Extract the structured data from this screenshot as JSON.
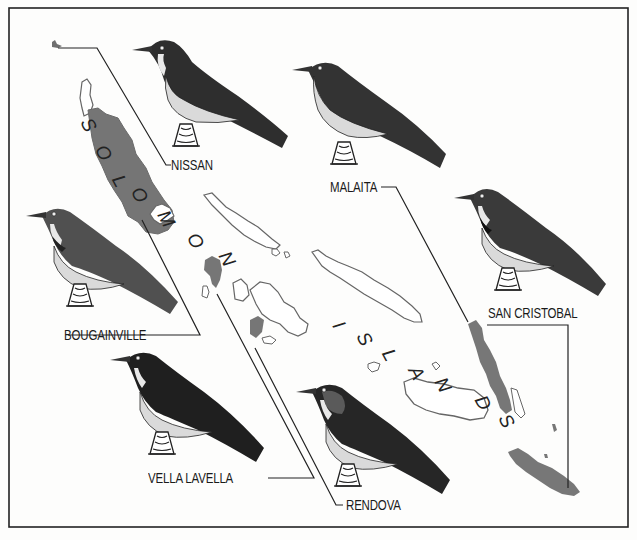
{
  "map": {
    "title_letters": [
      "S",
      "O",
      "L",
      "O",
      "M",
      "O",
      "N",
      "I",
      "S",
      "L",
      "A",
      "N",
      "D",
      "S"
    ],
    "title": "SOLOMON ISLANDS",
    "colors": {
      "frame": "#222222",
      "highlighted_island": "#7a7a7a",
      "island_outline": "#666666",
      "bird_dark": "#2a2a2a",
      "bird_mid": "#555555",
      "bird_belly": "#d8d8d8",
      "leader_line": "#222222"
    },
    "labels": [
      {
        "id": "nissan",
        "text": "NISSAN"
      },
      {
        "id": "malaita",
        "text": "MALAITA"
      },
      {
        "id": "bougainville",
        "text": "BOUGAINVILLE"
      },
      {
        "id": "san_cristobal",
        "text": "SAN CRISTOBAL"
      },
      {
        "id": "vella_lavella",
        "text": "VELLA LAVELLA"
      },
      {
        "id": "rendova",
        "text": "RENDOVA"
      }
    ]
  }
}
